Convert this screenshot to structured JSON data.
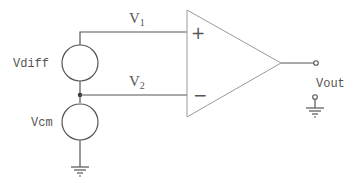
{
  "diagram": {
    "type": "op-amp differential input circuit",
    "labels": {
      "v1": {
        "main": "V",
        "sub": "1"
      },
      "v2": {
        "main": "V",
        "sub": "2"
      },
      "vdiff": "Vdiff",
      "vcm": "Vcm",
      "vout": "Vout",
      "plus": "+",
      "minus": "−"
    },
    "colors": {
      "wire": "#555555",
      "amplifier": "#9a9a9a",
      "background": "#ffffff"
    }
  }
}
